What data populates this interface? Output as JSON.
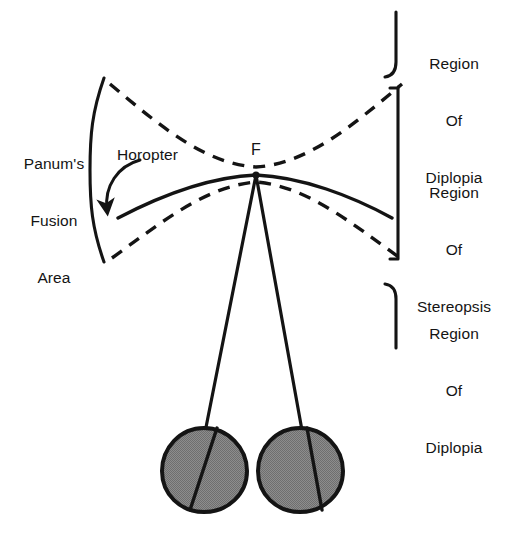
{
  "figure": {
    "background_color": "#ffffff",
    "stroke_color": "#141414",
    "eye_fill_color": "#808080"
  },
  "labels": {
    "panums_line1": "Panum's",
    "panums_line2": "Fusion",
    "panums_line3": "Area",
    "horopter": "Horopter",
    "fixation_point": "F",
    "region_top_line1": "Region",
    "region_top_line2": "Of",
    "region_top_line3": "Diplopia",
    "region_mid_line1": "Region",
    "region_mid_line2": "Of",
    "region_mid_line3": "Stereopsis",
    "region_bot_line1": "Region",
    "region_bot_line2": "Of",
    "region_bot_line3": "Diplopia"
  },
  "diagram_elements": {
    "left_bracket": "large-parenthesis-open",
    "right_bracket_top": "hook-bracket-down",
    "right_bracket_middle": "square-bracket-close",
    "right_bracket_bottom": "hook-bracket-up",
    "upper_dashed_curve": "panum-outer-boundary",
    "lower_dashed_curve": "panum-inner-boundary",
    "solid_curve": "horopter-curve",
    "left_eye": "eye-globe-left",
    "right_eye": "eye-globe-right",
    "left_visual_axis": "visual-axis-left",
    "right_visual_axis": "visual-axis-right",
    "horopter_arrow": "curved-pointer-arrow"
  }
}
